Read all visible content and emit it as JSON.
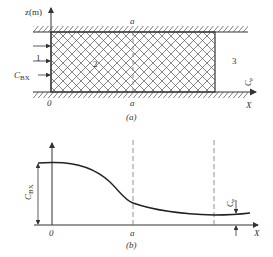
{
  "figure_a": {
    "caption": "(a)",
    "z_axis_label": "z(m)",
    "origin_label": "0",
    "a_label_top": "a",
    "a_label_bottom": "a",
    "region_1_label": "1",
    "region_2_label": "2",
    "region_3_label": "3",
    "inflow_label_main": "C",
    "inflow_label_sub": "BX",
    "outflow_label_main": "C",
    "outflow_label_sub": "e",
    "x_axis_label": "X"
  },
  "figure_b": {
    "caption": "(b)",
    "origin_label": "0",
    "a_label": "a",
    "y_marker_main": "C",
    "y_marker_sub": "BX",
    "end_marker_main": "C",
    "end_marker_sub": "e",
    "x_axis_label": "X"
  },
  "colors": {
    "line": "#333333",
    "hatch": "#555555",
    "dashed": "#777777"
  }
}
